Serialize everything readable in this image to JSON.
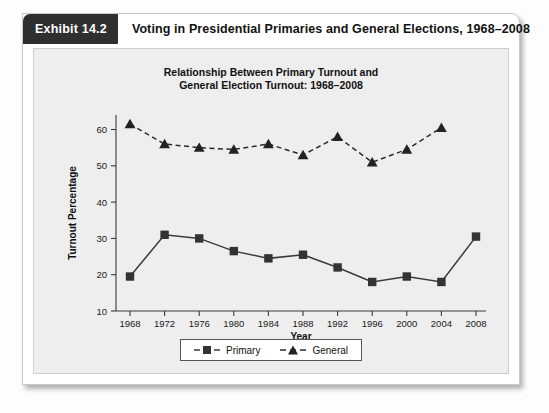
{
  "exhibit": {
    "badge": "Exhibit 14.2",
    "header_title": "Voting in Presidential Primaries and General Elections, 1968–2008"
  },
  "legend": {
    "primary_label": "Primary",
    "general_label": "General",
    "position": "bottom-center"
  },
  "chart_data": {
    "type": "line",
    "title": "Relationship Between Primary Turnout and\nGeneral Election Turnout: 1968–2008",
    "xlabel": "Year",
    "ylabel": "Turnout Percentage",
    "categories": [
      1968,
      1972,
      1976,
      1980,
      1984,
      1988,
      1992,
      1996,
      2000,
      2004,
      2008
    ],
    "xtick_labels": [
      "1968",
      "1972",
      "1976",
      "1980",
      "1984",
      "1988",
      "1992",
      "1996",
      "2000",
      "2004",
      "2008"
    ],
    "ytick_labels": [
      "10",
      "20",
      "30",
      "40",
      "50",
      "60"
    ],
    "ylim": [
      10,
      64
    ],
    "yticks": [
      10,
      20,
      30,
      40,
      50,
      60
    ],
    "grid": false,
    "series": [
      {
        "name": "Primary",
        "marker": "square",
        "linestyle": "solid",
        "color": "#333333",
        "values": [
          19.5,
          31.0,
          30.0,
          26.5,
          24.5,
          25.5,
          22.0,
          18.0,
          19.5,
          18.0,
          30.5
        ]
      },
      {
        "name": "General",
        "marker": "triangle",
        "linestyle": "dashed",
        "color": "#222222",
        "values": [
          61.5,
          56.0,
          55.0,
          54.5,
          56.0,
          53.0,
          58.0,
          51.0,
          54.5,
          60.5,
          null
        ]
      }
    ]
  }
}
